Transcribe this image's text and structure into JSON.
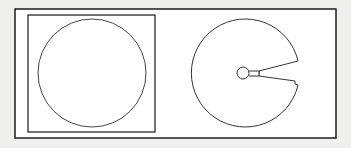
{
  "diagram": {
    "colors": {
      "background": "#efefed",
      "panel": "#ffffff",
      "stroke": "#2a2a2a"
    },
    "left_figure": {
      "label": "circle-in-square"
    },
    "right_figure": {
      "label": "circle-with-wedge-slit"
    }
  }
}
